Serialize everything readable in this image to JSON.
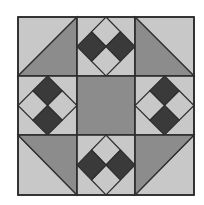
{
  "colors": {
    "background": "#ffffff",
    "light": "#c8c8c8",
    "medium": "#8c8c8c",
    "dark": "#3a3a3a",
    "line": "#2e2e2e"
  },
  "grid": {
    "rows": 3,
    "cols": 3,
    "x_edges": [
      18,
      77,
      135,
      194
    ],
    "y_edges": [
      17,
      76,
      135,
      195
    ]
  },
  "cells": [
    {
      "row": 0,
      "col": 0,
      "type": "half-square-triangle",
      "diagonal": "bl-tr",
      "shaded": "bottom-right",
      "name": "corner-top-left"
    },
    {
      "row": 0,
      "col": 1,
      "type": "diamond-four-patch",
      "dark": [
        "left",
        "right"
      ],
      "name": "edge-top"
    },
    {
      "row": 0,
      "col": 2,
      "type": "half-square-triangle",
      "diagonal": "tl-br",
      "shaded": "bottom-left",
      "name": "corner-top-right"
    },
    {
      "row": 1,
      "col": 0,
      "type": "diamond-four-patch",
      "dark": [
        "top",
        "bottom"
      ],
      "name": "edge-left"
    },
    {
      "row": 1,
      "col": 1,
      "type": "solid",
      "fill": "medium",
      "name": "center-square"
    },
    {
      "row": 1,
      "col": 2,
      "type": "diamond-four-patch",
      "dark": [
        "top",
        "bottom"
      ],
      "name": "edge-right"
    },
    {
      "row": 2,
      "col": 0,
      "type": "half-square-triangle",
      "diagonal": "tl-br",
      "shaded": "top-right",
      "name": "corner-bottom-left"
    },
    {
      "row": 2,
      "col": 1,
      "type": "diamond-four-patch",
      "dark": [
        "left",
        "right"
      ],
      "name": "edge-bottom"
    },
    {
      "row": 2,
      "col": 2,
      "type": "half-square-triangle",
      "diagonal": "bl-tr",
      "shaded": "top-left",
      "name": "corner-bottom-right"
    }
  ]
}
